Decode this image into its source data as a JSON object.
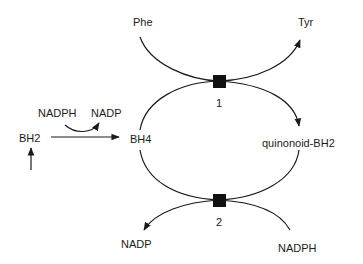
{
  "diagram": {
    "nodes": {
      "phe": "Phe",
      "tyr": "Tyr",
      "nadph_top": "NADPH",
      "nadp_top": "NADP",
      "bh2": "BH2",
      "bh4": "BH4",
      "quinonoid_bh2": "quinonoid-BH2",
      "nadp_bottom": "NADP",
      "nadph_bottom": "NADPH"
    },
    "enzymes": {
      "enzyme1": "1",
      "enzyme2": "2"
    },
    "colors": {
      "line": "#1a1a1a",
      "background": "#ffffff"
    }
  }
}
